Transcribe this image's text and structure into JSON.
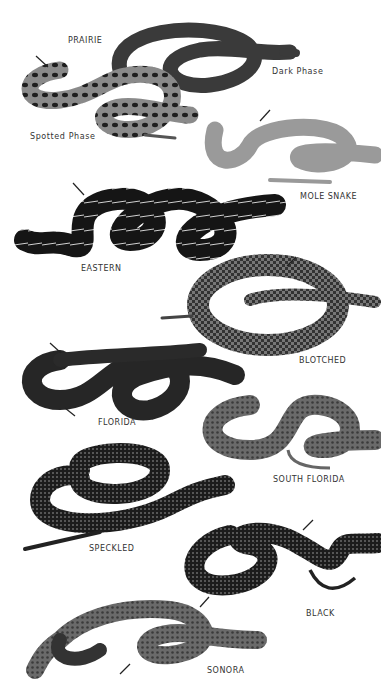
{
  "plate": {
    "labels": {
      "prairie": "PRAIRIE",
      "dark_phase": "Dark Phase",
      "spotted_phase": "Spotted Phase",
      "mole_snake": "MOLE SNAKE",
      "eastern": "EASTERN",
      "blotched": "BLOTCHED",
      "florida": "FLORIDA",
      "south_florida": "SOUTH FLORIDA",
      "speckled": "SPECKLED",
      "black": "BLACK",
      "sonora": "SONORA"
    },
    "colors": {
      "background": "#ffffff",
      "dark_snake": "#1a1a1a",
      "mid_snake": "#555555",
      "light_snake": "#9a9a9a",
      "text": "#333333"
    }
  }
}
